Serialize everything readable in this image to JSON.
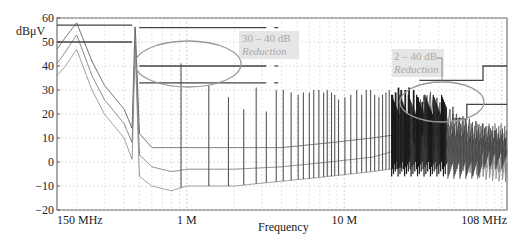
{
  "chart_data": {
    "type": "line",
    "title": "",
    "xlabel": "Frequency",
    "ylabel": "dBμV",
    "xscale": "log",
    "xlim_hz": [
      150000,
      108000000
    ],
    "ylim": [
      -20,
      60
    ],
    "grid": true,
    "y_ticks": [
      "60",
      "50",
      "40",
      "30",
      "20",
      "10",
      "0",
      "−10",
      "−20"
    ],
    "y_tick_values": [
      60,
      50,
      40,
      30,
      20,
      10,
      0,
      -10,
      -20
    ],
    "x_ticks": [
      "150 MHz",
      "1 M",
      "10 M",
      "108 MHz"
    ],
    "x_tick_values_hz": [
      150000,
      1000000,
      10000000,
      108000000
    ],
    "series": [
      {
        "name": "Spectrum (upper trace)",
        "color": "#555555",
        "x_mhz": [
          0.15,
          0.17,
          0.2,
          0.25,
          0.3,
          0.4,
          0.45,
          0.47,
          0.5,
          0.6,
          0.8,
          1.0,
          2,
          4,
          8,
          15,
          25,
          28,
          35,
          50,
          80,
          108
        ],
        "y": [
          47,
          52,
          58,
          42,
          32,
          22,
          14,
          58,
          12,
          6,
          6,
          6,
          6,
          6,
          8,
          10,
          12,
          20,
          24,
          15,
          10,
          5
        ]
      },
      {
        "name": "Spectrum (middle trace)",
        "color": "#707070",
        "x_mhz": [
          0.15,
          0.17,
          0.2,
          0.25,
          0.3,
          0.4,
          0.45,
          0.47,
          0.5,
          0.6,
          0.8,
          1.0,
          2,
          4,
          8,
          15,
          25,
          28,
          35,
          50,
          80,
          108
        ],
        "y": [
          41,
          46,
          53,
          36,
          26,
          16,
          8,
          52,
          3,
          -2,
          -4,
          -3,
          -3,
          -2,
          0,
          2,
          6,
          16,
          18,
          8,
          3,
          0
        ]
      },
      {
        "name": "Spectrum (lower trace)",
        "color": "#8a8a8a",
        "x_mhz": [
          0.15,
          0.17,
          0.2,
          0.25,
          0.3,
          0.4,
          0.45,
          0.47,
          0.5,
          0.6,
          0.8,
          1.0,
          2,
          4,
          8,
          15,
          25,
          28,
          35,
          50,
          80,
          108
        ],
        "y": [
          36,
          40,
          47,
          30,
          20,
          10,
          1,
          48,
          -6,
          -10,
          -12,
          -10,
          -10,
          -8,
          -6,
          -4,
          -2,
          10,
          12,
          2,
          -2,
          -3
        ]
      }
    ],
    "harmonic_peaks_mhz": [
      0.46,
      0.92,
      1.38,
      1.84,
      2.3,
      2.76,
      3.2,
      3.7,
      4.1,
      4.6,
      5.1,
      5.5,
      6.0,
      6.4,
      6.9,
      7.4,
      7.8,
      8.3,
      8.7,
      9.2,
      10.1,
      11.0,
      12.0,
      12.9,
      13.8,
      14.7,
      15.6,
      16.6,
      17.5,
      18.4,
      19.3,
      20.2,
      21.2,
      22.1,
      23.0,
      24.4,
      25.8,
      27.6,
      29.4,
      31.3
    ],
    "harmonic_peak_levels_db": [
      57,
      41,
      32,
      27,
      22,
      31,
      21,
      30,
      30,
      29,
      28,
      29,
      29,
      30,
      30,
      29,
      30,
      29,
      28,
      26,
      27,
      28,
      30,
      28,
      30,
      30,
      28,
      27,
      28,
      29,
      30,
      28,
      29,
      31,
      30,
      30,
      31,
      30,
      27,
      25
    ],
    "limit_lines": [
      {
        "name": "Limit A (low band, upper)",
        "x_mhz": [
          0.15,
          0.45
        ],
        "y": [
          57,
          57
        ]
      },
      {
        "name": "Limit A (low band, lower)",
        "x_mhz": [
          0.15,
          0.45
        ],
        "y": [
          50,
          50
        ]
      },
      {
        "name": "Limit B (upper)",
        "x_mhz": [
          0.5,
          3.2
        ],
        "y": [
          56,
          56
        ]
      },
      {
        "name": "Limit B (middle)",
        "x_mhz": [
          0.5,
          3.2
        ],
        "y": [
          40,
          40
        ]
      },
      {
        "name": "Limit B (lower)",
        "x_mhz": [
          0.5,
          3.2
        ],
        "y": [
          33,
          33
        ]
      },
      {
        "name": "Limit C (stepped, upper)",
        "x_mhz": [
          30,
          76,
          76,
          108
        ],
        "y": [
          34,
          34,
          40,
          40
        ]
      },
      {
        "name": "Limit C (stepped, lower)",
        "x_mhz": [
          49,
          49,
          60,
          60,
          108
        ],
        "y": [
          23,
          18,
          18,
          24,
          24
        ]
      }
    ],
    "annotations": [
      {
        "text_line1": "30 – 40 dB",
        "text_line2": "Reduction",
        "target": "ellipse around 0.5–3 MHz harmonic peaks"
      },
      {
        "text_line1": "2 – 40 dB",
        "text_line2": "Reduction",
        "target": "ellipse around 20–45 MHz band"
      }
    ]
  },
  "labels": {
    "ylabel": "dBμV",
    "xlabel": "Frequency",
    "annot1_line1": "30 – 40 dB",
    "annot1_line2": "Reduction",
    "annot2_line1": "2 – 40 dB",
    "annot2_line2": "Reduction"
  }
}
